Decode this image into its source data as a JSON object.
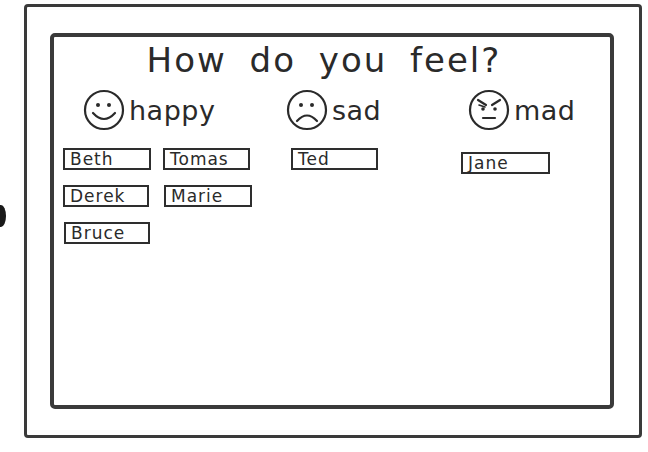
{
  "title": "How do you feel?",
  "moods": [
    {
      "label": "happy",
      "icon": "happy-face-icon"
    },
    {
      "label": "sad",
      "icon": "sad-face-icon"
    },
    {
      "label": "mad",
      "icon": "mad-face-icon"
    }
  ],
  "groups": {
    "happy": [
      "Beth",
      "Tomas",
      "Derek",
      "Marie",
      "Bruce"
    ],
    "sad": [
      "Ted"
    ],
    "mad": [
      "Jane"
    ]
  },
  "colors": {
    "ink": "#2a2a2a",
    "background": "#ffffff"
  }
}
